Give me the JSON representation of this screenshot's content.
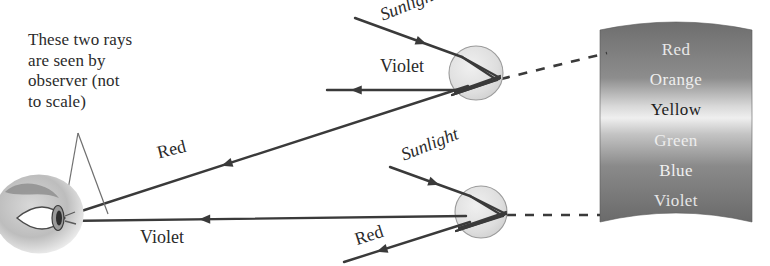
{
  "figure": {
    "background_color": "#ffffff",
    "ink_color": "#3a3a3a",
    "text_color": "#2b2b2b"
  },
  "caption": {
    "lines": [
      "These two rays",
      "are seen by",
      "observer (not",
      "to scale)"
    ],
    "full_text": "These two rays are seen by observer (not to scale)",
    "x": 28,
    "y": 30,
    "font_size": 17
  },
  "observer": {
    "name": "eye",
    "center_x": 45,
    "center_y": 218,
    "width": 86,
    "height": 76,
    "pupil_x": 62,
    "pupil_y": 218
  },
  "leader_lines": [
    {
      "x1": 78,
      "y1": 133,
      "x2": 63,
      "y2": 218
    },
    {
      "x1": 78,
      "y1": 133,
      "x2": 108,
      "y2": 214
    }
  ],
  "raindrops": [
    {
      "id": "upper-raindrop",
      "cx": 476,
      "cy": 73,
      "r": 27,
      "fill": "#e2e2e2",
      "stroke": "#9a9a9a"
    },
    {
      "id": "lower-raindrop",
      "cx": 481,
      "cy": 212,
      "r": 26,
      "fill": "#e2e2e2",
      "stroke": "#9a9a9a"
    }
  ],
  "rays": [
    {
      "id": "upper-sunlight",
      "label": "Sunlight",
      "label_x": 377,
      "label_y": 6,
      "label_rotation": -22,
      "label_font_size": 18,
      "label_italic": true,
      "x1": 355,
      "y1": 18,
      "x2": 462,
      "y2": 57,
      "arrow_at": 0.62,
      "arrow_dir": "down-right"
    },
    {
      "id": "upper-violet-out",
      "label": "Violet",
      "label_x": 380,
      "label_y": 56,
      "label_rotation": 0,
      "label_font_size": 18,
      "label_italic": false,
      "x1": 327,
      "y1": 90,
      "x2": 460,
      "y2": 90,
      "arrow_at": 0.22,
      "arrow_dir": "left"
    },
    {
      "id": "upper-red-to-eye",
      "label": "Red",
      "label_x": 155,
      "label_y": 143,
      "label_rotation": -14,
      "label_font_size": 18,
      "label_italic": false,
      "x1": 66,
      "y1": 216,
      "x2": 468,
      "y2": 86,
      "arrow_at": 0.4,
      "arrow_dir": "left"
    },
    {
      "id": "lower-sunlight",
      "label": "Sunlight",
      "label_x": 398,
      "label_y": 146,
      "label_rotation": -22,
      "label_font_size": 18,
      "label_italic": true,
      "x1": 390,
      "y1": 167,
      "x2": 470,
      "y2": 196,
      "arrow_at": 0.55,
      "arrow_dir": "down-right"
    },
    {
      "id": "lower-violet-to-eye",
      "label": "Violet",
      "label_x": 140,
      "label_y": 227,
      "label_rotation": 0,
      "label_font_size": 18,
      "label_italic": false,
      "x1": 64,
      "y1": 221,
      "x2": 466,
      "y2": 216,
      "arrow_at": 0.35,
      "arrow_dir": "left"
    },
    {
      "id": "lower-red-out",
      "label": "Red",
      "label_x": 352,
      "label_y": 230,
      "label_rotation": -18,
      "label_font_size": 18,
      "label_italic": false,
      "x1": 344,
      "y1": 262,
      "x2": 470,
      "y2": 222,
      "arrow_at": 0.3,
      "arrow_dir": "down-left"
    }
  ],
  "internal_rays": {
    "upper": [
      {
        "x1": 462,
        "y1": 57,
        "x2": 500,
        "y2": 78
      },
      {
        "x1": 462,
        "y1": 57,
        "x2": 497,
        "y2": 80
      },
      {
        "x1": 500,
        "y1": 78,
        "x2": 455,
        "y2": 92
      },
      {
        "x1": 497,
        "y1": 80,
        "x2": 452,
        "y2": 95
      },
      {
        "x1": 455,
        "y1": 92,
        "x2": 500,
        "y2": 76
      },
      {
        "x1": 452,
        "y1": 95,
        "x2": 499,
        "y2": 79
      }
    ],
    "lower": [
      {
        "x1": 470,
        "y1": 196,
        "x2": 506,
        "y2": 214
      },
      {
        "x1": 470,
        "y1": 196,
        "x2": 503,
        "y2": 216
      },
      {
        "x1": 506,
        "y1": 214,
        "x2": 459,
        "y2": 228
      },
      {
        "x1": 503,
        "y1": 216,
        "x2": 456,
        "y2": 231
      },
      {
        "x1": 459,
        "y1": 228,
        "x2": 506,
        "y2": 212
      },
      {
        "x1": 456,
        "y1": 231,
        "x2": 504,
        "y2": 215
      }
    ]
  },
  "dashed_lines": [
    {
      "id": "upper-dashed",
      "x1": 501,
      "y1": 79,
      "x2": 607,
      "y2": 53
    },
    {
      "id": "lower-dashed",
      "x1": 507,
      "y1": 215,
      "x2": 600,
      "y2": 215
    }
  ],
  "spectrum_band": {
    "left": 600,
    "right": 752,
    "top": 30,
    "bottom": 222,
    "top_arc_rise": 16,
    "bottom_arc_rise": 18,
    "gradient_stops": [
      {
        "offset": 0,
        "color": "#6e6e6e"
      },
      {
        "offset": 0.28,
        "color": "#8d8d8d"
      },
      {
        "offset": 0.42,
        "color": "#d8d8d8"
      },
      {
        "offset": 0.48,
        "color": "#efefef"
      },
      {
        "offset": 0.56,
        "color": "#c4c4c4"
      },
      {
        "offset": 0.72,
        "color": "#8a8a8a"
      },
      {
        "offset": 1,
        "color": "#6a6a6a"
      }
    ],
    "labels": [
      {
        "text": "Red",
        "y": 40,
        "color": "#e8e8e8"
      },
      {
        "text": "Orange",
        "y": 70,
        "color": "#efefef"
      },
      {
        "text": "Yellow",
        "y": 100,
        "color": "#1d1d1d"
      },
      {
        "text": "Green",
        "y": 131,
        "color": "#ededed"
      },
      {
        "text": "Blue",
        "y": 161,
        "color": "#f0f0f0"
      },
      {
        "text": "Violet",
        "y": 191,
        "color": "#e6e6e6"
      }
    ],
    "label_center_x": 676
  }
}
